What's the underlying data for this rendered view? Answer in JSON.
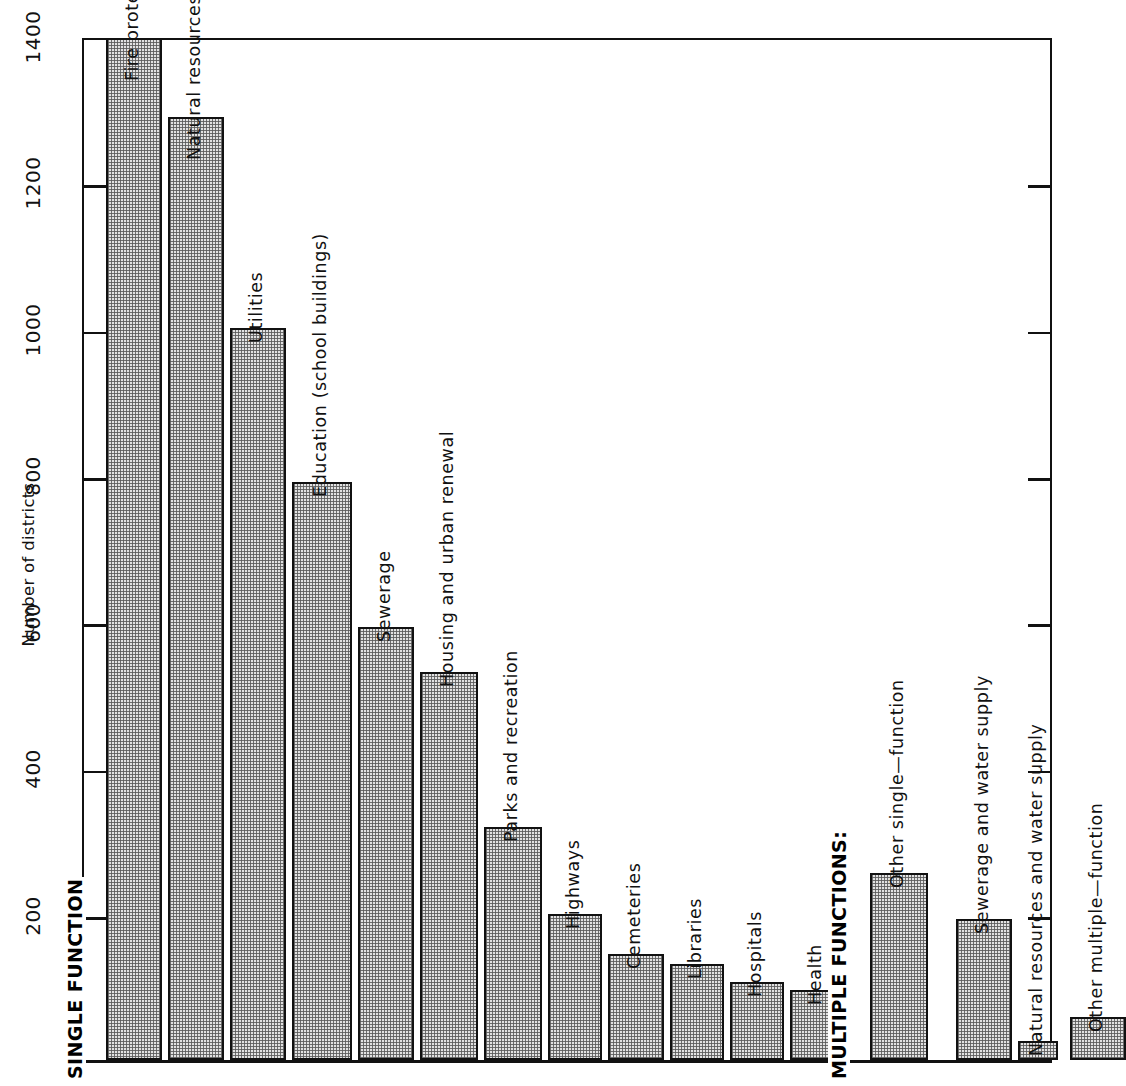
{
  "chart_data": {
    "type": "bar",
    "title": "",
    "subtitle": "",
    "xlabel": "",
    "ylabel": "Number of districts",
    "ylim": [
      0,
      1400
    ],
    "yticks": [
      200,
      400,
      600,
      800,
      1000,
      1200,
      1400
    ],
    "ytick_labels": [
      "200",
      "400",
      "600",
      "800",
      "1000",
      "1200",
      "1400"
    ],
    "grid": false,
    "legend": "none",
    "orientation": "vertical",
    "bar_label_orientation": "rotated-90",
    "categories": [
      "Fire protection",
      "Natural resources",
      "Utilities",
      "Education (school buildings)",
      "Sewerage",
      "Housing and urban renewal",
      "Parks and recreation",
      "Highways",
      "Cemeteries",
      "Libraries",
      "Hospitals",
      "Health",
      "Other single—function",
      "Sewerage and water supply",
      "Natural resources and water supply",
      "Other multiple—function"
    ],
    "values": [
      1396,
      1288,
      1000,
      790,
      592,
      530,
      318,
      200,
      145,
      131,
      106,
      96,
      255,
      193,
      26,
      59
    ],
    "groups": [
      {
        "label": "SINGLE FUNCTION",
        "categories": [
          "Fire protection",
          "Natural resources",
          "Utilities",
          "Education (school buildings)",
          "Sewerage",
          "Housing and urban renewal",
          "Parks and recreation",
          "Highways",
          "Cemeteries",
          "Libraries",
          "Hospitals",
          "Health",
          "Other single—function"
        ]
      },
      {
        "label": "MULTIPLE FUNCTIONS:",
        "categories": [
          "Sewerage and water supply",
          "Natural resources and water supply",
          "Other multiple—function"
        ]
      }
    ],
    "colors": {
      "bar_fill": "#e2e2e2",
      "bar_stipple": "#5a5a5a",
      "bar_edge": "#111111",
      "axis": "#111111",
      "background": "#ffffff",
      "text": "#111111"
    }
  },
  "axis": {
    "y_title": "Number of districts",
    "ticks": [
      {
        "label": "1400",
        "value": 1400
      },
      {
        "label": "1200",
        "value": 1200
      },
      {
        "label": "1000",
        "value": 1000
      },
      {
        "label": "800",
        "value": 800
      },
      {
        "label": "600",
        "value": 600
      },
      {
        "label": "400",
        "value": 400
      },
      {
        "label": "200",
        "value": 200
      }
    ]
  },
  "group_headings": [
    {
      "label": "SINGLE FUNCTION"
    },
    {
      "label": "MULTIPLE FUNCTIONS:"
    }
  ],
  "bars": [
    {
      "label": "Fire protection",
      "value": 1396,
      "label_inside": true
    },
    {
      "label": "Natural resources",
      "value": 1288,
      "label_inside": true
    },
    {
      "label": "Utilities",
      "value": 1000,
      "label_inside": false
    },
    {
      "label": "Education (school buildings)",
      "value": 790,
      "label_inside": false
    },
    {
      "label": "Sewerage",
      "value": 592,
      "label_inside": false
    },
    {
      "label": "Housing and urban renewal",
      "value": 530,
      "label_inside": false
    },
    {
      "label": "Parks and recreation",
      "value": 318,
      "label_inside": false
    },
    {
      "label": "Highways",
      "value": 200,
      "label_inside": false
    },
    {
      "label": "Cemeteries",
      "value": 145,
      "label_inside": false
    },
    {
      "label": "Libraries",
      "value": 131,
      "label_inside": false
    },
    {
      "label": "Hospitals",
      "value": 106,
      "label_inside": false
    },
    {
      "label": "Health",
      "value": 96,
      "label_inside": false
    },
    {
      "label": "Other single—function",
      "value": 255,
      "label_inside": false
    },
    {
      "label": "Sewerage and water supply",
      "value": 193,
      "label_inside": false
    },
    {
      "label": "Natural resources and water supply",
      "value": 26,
      "label_inside": false
    },
    {
      "label": "Other multiple—function",
      "value": 59,
      "label_inside": false
    }
  ]
}
